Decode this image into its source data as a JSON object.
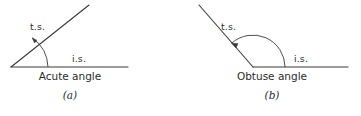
{
  "sheet": {
    "background_color": "#ffffff",
    "stroke_color": "#3a3a3a",
    "text_color": "#2b2b2b"
  },
  "figures": [
    {
      "id": "a",
      "index_label": "(a)",
      "caption": "Acute angle",
      "terminal_side_label": "t.s.",
      "initial_side_label": "i.s.",
      "rotation_direction": "counterclockwise",
      "angle_degrees": 30,
      "vertex": {
        "x": 11,
        "y": 67
      },
      "initial_side_end": {
        "x": 128,
        "y": 67
      },
      "terminal_side_end": {
        "x": 89,
        "y": 5
      }
    },
    {
      "id": "b",
      "index_label": "(b)",
      "caption": "Obtuse angle",
      "terminal_side_label": "t.s.",
      "initial_side_label": "i.s.",
      "rotation_direction": "counterclockwise",
      "angle_degrees": 132,
      "vertex": {
        "x": 73,
        "y": 67
      },
      "initial_side_end": {
        "x": 168,
        "y": 67
      },
      "terminal_side_end": {
        "x": 19,
        "y": 5
      }
    }
  ]
}
